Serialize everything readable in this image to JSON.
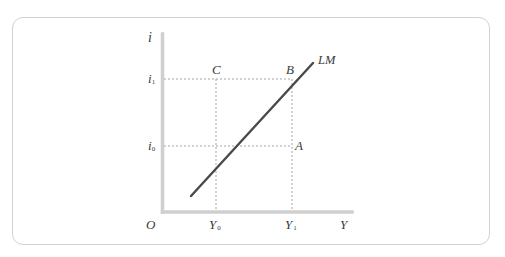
{
  "diagram": {
    "type": "economics-graph",
    "curve": {
      "label": "LM",
      "color": "#4a4a4a"
    },
    "axes": {
      "y_label": "i",
      "x_label": "Y",
      "origin_label": "O",
      "color": "#cfcfcf"
    },
    "y_ticks": [
      {
        "label": "i",
        "sub": "1"
      },
      {
        "label": "i",
        "sub": "0"
      }
    ],
    "x_ticks": [
      {
        "label": "Y",
        "sub": "0"
      },
      {
        "label": "Y",
        "sub": "1"
      }
    ],
    "points": [
      {
        "label": "C"
      },
      {
        "label": "B"
      },
      {
        "label": "A"
      }
    ],
    "guide_color": "#9a9a9a"
  }
}
